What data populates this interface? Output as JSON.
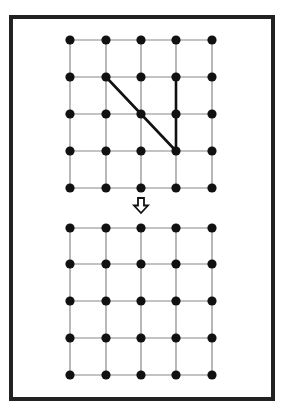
{
  "figure": {
    "frame": {
      "x": 11,
      "y": 17,
      "width": 262,
      "height": 382,
      "stroke": "#222222",
      "stroke_width": 4
    },
    "grid": {
      "columns_x": [
        70,
        106,
        141,
        176,
        212
      ],
      "dot_radius": 4.6,
      "dot_color": "#111111",
      "line_color": "#888888",
      "line_width": 1.2
    },
    "top_grid": {
      "rows_y": [
        40,
        77,
        114,
        151,
        188
      ],
      "highlighted_segments": [
        {
          "from": [
            1,
            1
          ],
          "to": [
            3,
            3
          ],
          "label": "diagonal"
        },
        {
          "from": [
            3,
            1
          ],
          "to": [
            3,
            3
          ],
          "label": "vertical"
        }
      ],
      "highlight_color": "#111111",
      "highlight_width": 2.6
    },
    "arrow": {
      "icon": "hollow-down-arrow",
      "cx": 141,
      "top": 198,
      "bottom": 213
    },
    "bottom_grid": {
      "rows_y": [
        228,
        264,
        301,
        338,
        375
      ],
      "highlighted_segments": []
    }
  }
}
